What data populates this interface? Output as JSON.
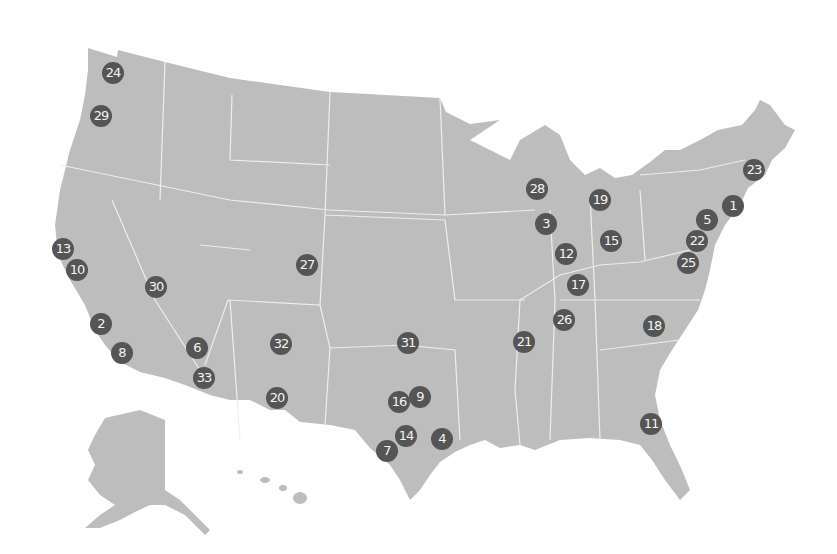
{
  "map": {
    "land_color": "#bdbdbd",
    "marker_color": "#555555",
    "marker_text_color": "#f4f4f4",
    "markers": [
      {
        "label": "1",
        "x": 733,
        "y": 206
      },
      {
        "label": "2",
        "x": 101,
        "y": 324
      },
      {
        "label": "3",
        "x": 546,
        "y": 224
      },
      {
        "label": "4",
        "x": 442,
        "y": 439
      },
      {
        "label": "5",
        "x": 707,
        "y": 220
      },
      {
        "label": "6",
        "x": 197,
        "y": 348
      },
      {
        "label": "7",
        "x": 387,
        "y": 451
      },
      {
        "label": "8",
        "x": 122,
        "y": 353
      },
      {
        "label": "9",
        "x": 420,
        "y": 397
      },
      {
        "label": "10",
        "x": 77,
        "y": 270
      },
      {
        "label": "11",
        "x": 651,
        "y": 424
      },
      {
        "label": "12",
        "x": 566,
        "y": 254
      },
      {
        "label": "13",
        "x": 63,
        "y": 249
      },
      {
        "label": "14",
        "x": 406,
        "y": 436
      },
      {
        "label": "15",
        "x": 611,
        "y": 241
      },
      {
        "label": "16",
        "x": 399,
        "y": 402
      },
      {
        "label": "17",
        "x": 578,
        "y": 285
      },
      {
        "label": "18",
        "x": 654,
        "y": 326
      },
      {
        "label": "19",
        "x": 600,
        "y": 200
      },
      {
        "label": "20",
        "x": 277,
        "y": 398
      },
      {
        "label": "21",
        "x": 524,
        "y": 342
      },
      {
        "label": "22",
        "x": 697,
        "y": 241
      },
      {
        "label": "23",
        "x": 754,
        "y": 170
      },
      {
        "label": "24",
        "x": 113,
        "y": 73
      },
      {
        "label": "25",
        "x": 688,
        "y": 263
      },
      {
        "label": "26",
        "x": 564,
        "y": 320
      },
      {
        "label": "27",
        "x": 307,
        "y": 265
      },
      {
        "label": "28",
        "x": 537,
        "y": 189
      },
      {
        "label": "29",
        "x": 101,
        "y": 116
      },
      {
        "label": "30",
        "x": 156,
        "y": 287
      },
      {
        "label": "31",
        "x": 408,
        "y": 343
      },
      {
        "label": "32",
        "x": 281,
        "y": 344
      },
      {
        "label": "33",
        "x": 204,
        "y": 378
      }
    ]
  }
}
